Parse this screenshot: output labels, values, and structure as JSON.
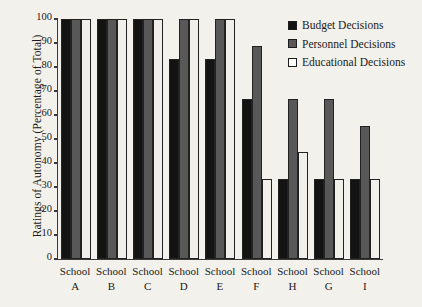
{
  "chart_data": {
    "type": "bar",
    "title": "",
    "xlabel": "",
    "ylabel": "Ratings of Autonomy (Percentage of Total)",
    "ylim": [
      0,
      100
    ],
    "ytick_values": [
      100,
      90,
      80,
      70,
      60,
      50,
      40,
      30,
      20,
      10,
      0
    ],
    "ytick_labels": [
      "100",
      "90",
      "80",
      "70",
      "60",
      "50",
      "40",
      "30",
      "20",
      "10",
      "0"
    ],
    "grid": false,
    "legend_position": "top-right",
    "categories": [
      "School A",
      "School B",
      "School C",
      "School D",
      "School E",
      "School F",
      "School H",
      "School G",
      "School I"
    ],
    "category_lines": [
      [
        "School",
        "A"
      ],
      [
        "School",
        "B"
      ],
      [
        "School",
        "C"
      ],
      [
        "School",
        "D"
      ],
      [
        "School",
        "E"
      ],
      [
        "School",
        "F"
      ],
      [
        "School",
        "H"
      ],
      [
        "School",
        "G"
      ],
      [
        "School",
        "I"
      ]
    ],
    "series": [
      {
        "name": "Budget Decisions",
        "color": "#131313",
        "values": [
          100,
          100,
          100,
          83.3,
          83.3,
          66.7,
          33.3,
          33.3,
          33.3
        ]
      },
      {
        "name": "Personnel Decisions",
        "color": "#585858",
        "values": [
          100,
          100,
          100,
          100,
          100,
          88.9,
          66.7,
          66.7,
          55.6
        ]
      },
      {
        "name": "Educational Decisions",
        "color": "#f0efe9",
        "values": [
          100,
          100,
          100,
          100,
          100,
          33.3,
          44.4,
          33.3,
          33.3
        ]
      }
    ]
  },
  "legend": {
    "items": [
      {
        "label": "Budget Decisions",
        "swatch": "filled-black-square-icon"
      },
      {
        "label": "Personnel Decisions",
        "swatch": "filled-gray-square-icon"
      },
      {
        "label": "Educational Decisions",
        "swatch": "empty-white-square-icon"
      }
    ]
  }
}
